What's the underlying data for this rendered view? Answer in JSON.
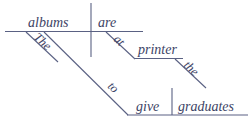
{
  "diagram": {
    "type": "reed-kellogg-sentence-diagram",
    "sentence": "The albums are at the printer to give graduates.",
    "colors": {
      "line": "#5a6183",
      "text": "#3d4466",
      "background": "#ffffff"
    },
    "words": {
      "subject": "albums",
      "subject_modifier": "The",
      "verb": "are",
      "preposition": "at",
      "prep_object": "printer",
      "prep_object_modifier": "the",
      "infinitive_marker": "to",
      "infinitive_verb": "give",
      "infinitive_object": "graduates"
    }
  }
}
